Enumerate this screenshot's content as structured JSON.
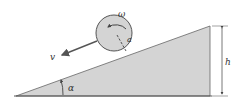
{
  "diagram": {
    "labels": {
      "omega": "ω",
      "radius": "a",
      "velocity": "v",
      "height": "h",
      "angle": "α"
    },
    "colors": {
      "fill": "#d4d4d4",
      "stroke": "#555555",
      "text": "#333333",
      "background": "#ffffff"
    }
  }
}
